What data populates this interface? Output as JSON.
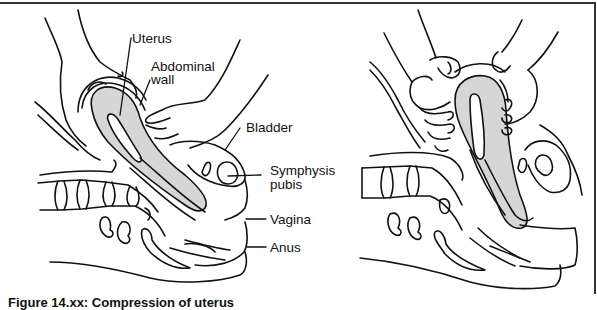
{
  "figure": {
    "left_panel": {
      "description": "Sagittal view: one hand on abdominal wall above uterus, other hand pressing lower abdomen",
      "labels": {
        "uterus": "Uterus",
        "abdominal_wall_line1": "Abdominal",
        "abdominal_wall_line2": "wall",
        "bladder": "Bladder",
        "symphysis_line1": "Symphysis",
        "symphysis_line2": "pubis",
        "vagina": "Vagina",
        "anus": "Anus"
      }
    },
    "right_panel": {
      "description": "Sagittal view: two hands grasping and compressing the uterus through abdominal wall"
    },
    "caption": "Figure 14.xx: Compression of uterus",
    "colors": {
      "line": "#111111",
      "uterus_fill": "#d6d6d6",
      "frame": "#333333",
      "background": "#ffffff"
    }
  }
}
